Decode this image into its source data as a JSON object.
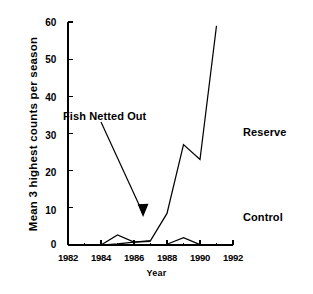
{
  "chart_data": {
    "type": "line",
    "title": "",
    "xlabel": "Year",
    "ylabel": "Mean 3 highest counts per season",
    "xlim": [
      1982,
      1992
    ],
    "ylim": [
      0,
      60
    ],
    "grid": false,
    "legend_position": "inline-annotations",
    "xticks": [
      1982,
      1984,
      1986,
      1988,
      1990,
      1992
    ],
    "xtick_labels": [
      "1982",
      "1984",
      "1986",
      "1988",
      "1990",
      "1992"
    ],
    "xminor_ticks": [
      1983,
      1985,
      1987,
      1989,
      1991
    ],
    "yticks": [
      0,
      10,
      20,
      30,
      40,
      50,
      60
    ],
    "ytick_labels": [
      "0",
      "10",
      "20",
      "30",
      "40",
      "50",
      "60"
    ],
    "series": [
      {
        "name": "Reserve",
        "x": [
          1984,
          1985,
          1986,
          1987,
          1988,
          1989,
          1990,
          1991
        ],
        "values": [
          0,
          0.3,
          0.8,
          1.2,
          8.5,
          27,
          23,
          59
        ]
      },
      {
        "name": "Control",
        "x": [
          1984,
          1985,
          1986,
          1987
        ],
        "values": [
          0,
          2.7,
          0.8,
          1.0
        ]
      },
      {
        "name": "Control",
        "x": [
          1988,
          1989,
          1990
        ],
        "values": [
          0.2,
          2.0,
          0.1
        ]
      }
    ],
    "annotations": [
      {
        "name": "fish-netted-out",
        "text": "Fish Netted Out",
        "arrow_to_x": 1986.55,
        "arrow_to_y": 8.5
      },
      {
        "name": "reserve-label",
        "text": "Reserve"
      },
      {
        "name": "control-label",
        "text": "Control"
      }
    ],
    "colors": {
      "line": "#000000",
      "axis": "#000000",
      "background": "#ffffff"
    }
  }
}
